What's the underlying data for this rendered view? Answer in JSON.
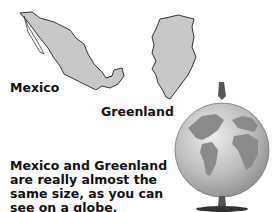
{
  "maps": {
    "mexico": {
      "label": "Mexico",
      "fill": "#c8c8c8",
      "stroke": "#333333"
    },
    "greenland": {
      "label": "Greenland",
      "fill": "#c8c8c8",
      "stroke": "#333333"
    }
  },
  "caption": {
    "lines": [
      "Mexico and Greenland",
      "are really almost the",
      "same size, as you can",
      "see on a globe."
    ]
  },
  "globe": {
    "ocean": "#bdbdbd",
    "land": "#8a8a8a",
    "stand": "#333333"
  }
}
